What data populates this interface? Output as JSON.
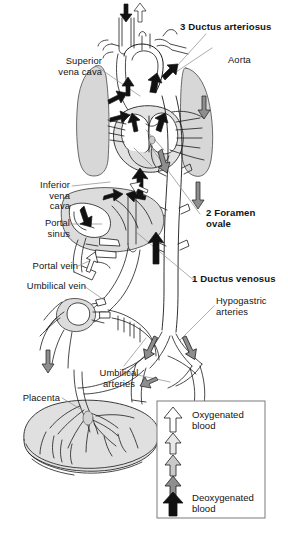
{
  "figure": {
    "background": "#ffffff",
    "ink": "#1a1a1a"
  },
  "labels": {
    "superior_vena_cava": "Superior\nvena cava",
    "inferior_vena_cava": "Inferior\nvena\ncava",
    "portal_sinus": "Portal\nsinus",
    "portal_vein": "Portal vein",
    "umbilical_vein": "Umbilical vein",
    "placenta": "Placenta",
    "umbilical_arteries": "Umbilical\narteries",
    "ductus_arteriosus": "3 Ductus arteriosus",
    "aorta": "Aorta",
    "foramen_ovale": "2 Foramen\novale",
    "ductus_venosus": "1 Ductus venosus",
    "hypogastric_arteries": "Hypogastric\narteries"
  },
  "legend": {
    "top_label": "Oxygenated\nblood",
    "bottom_label": "Deoxygenated\nblood",
    "arrows": [
      {
        "name": "arrow-oxygenated",
        "fill": "#ffffff",
        "stroke": "#1a1a1a"
      },
      {
        "name": "arrow-mostly-oxygenated",
        "fill": "#e8e8e8",
        "stroke": "#1a1a1a"
      },
      {
        "name": "arrow-mixed",
        "fill": "#c9c9c9",
        "stroke": "#1a1a1a"
      },
      {
        "name": "arrow-mostly-deoxygenated",
        "fill": "#8e8e8e",
        "stroke": "#1a1a1a"
      },
      {
        "name": "arrow-deoxygenated",
        "fill": "#111111",
        "stroke": "#111111"
      }
    ],
    "box_stroke": "#7a7a7a"
  },
  "anatomy": {
    "lung_fill": "#d7d7d7",
    "organ_fill": "#dcdcdc",
    "heart_fill": "#e3e3e3",
    "placenta_fill": "#e0e0e0",
    "vessel_fill": "#ffffff",
    "leader_stroke": "#8a8a8a"
  }
}
